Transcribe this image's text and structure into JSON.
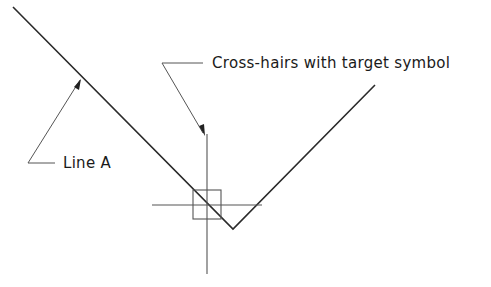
{
  "diagram": {
    "labels": {
      "crosshairs": "Cross-hairs with target symbol",
      "line_a": "Line A"
    },
    "colors": {
      "line": "#2a2a2a",
      "thin": "#555555",
      "background": "#ffffff"
    }
  }
}
